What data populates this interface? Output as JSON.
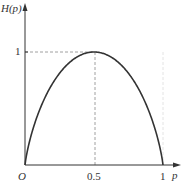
{
  "chart_data": {
    "type": "line",
    "title": "",
    "xlabel": "p",
    "ylabel": "H(p)",
    "xlim": [
      0,
      1
    ],
    "ylim": [
      0,
      1
    ],
    "x_ticks": [
      "O",
      "0.5",
      "1"
    ],
    "y_ticks": [
      "1"
    ],
    "grid": false,
    "legend": null,
    "series": [
      {
        "name": "H(p)",
        "x": [
          0,
          0.05,
          0.1,
          0.2,
          0.3,
          0.4,
          0.5,
          0.6,
          0.7,
          0.8,
          0.9,
          0.95,
          1
        ],
        "values": [
          0,
          0.286,
          0.469,
          0.722,
          0.881,
          0.971,
          1,
          0.971,
          0.881,
          0.722,
          0.469,
          0.286,
          0
        ]
      }
    ],
    "annotations": [
      {
        "type": "dashed-line",
        "description": "horizontal from y-axis at H=1 to peak"
      },
      {
        "type": "dashed-line",
        "description": "vertical from peak down to p=0.5"
      }
    ]
  },
  "labels": {
    "y_axis": "H(p)",
    "x_axis": "p",
    "origin": "O",
    "x_half": "0.5",
    "x_one": "1",
    "y_one": "1"
  }
}
